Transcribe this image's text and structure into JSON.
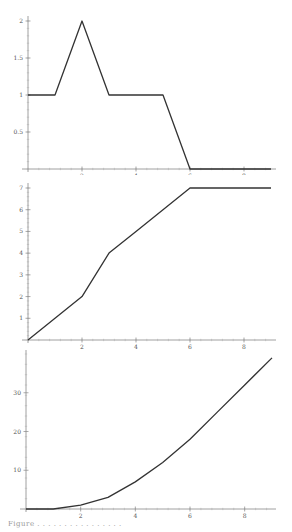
{
  "chart_data": [
    {
      "type": "line",
      "title": "",
      "xlabel": "",
      "ylabel": "",
      "x": [
        0,
        1,
        2,
        3,
        5,
        6,
        9
      ],
      "values": [
        1,
        1,
        2,
        1,
        1,
        0,
        0
      ],
      "xlim": [
        0,
        9
      ],
      "ylim": [
        0,
        2
      ],
      "xticks": [
        "2",
        "4",
        "6",
        "8"
      ],
      "yticks": [
        "0.5",
        "1",
        "1.5",
        "2"
      ],
      "grid": false,
      "line_color": "#333333"
    },
    {
      "type": "line",
      "title": "",
      "xlabel": "",
      "ylabel": "",
      "x": [
        0,
        1,
        2,
        3,
        4,
        5,
        6,
        9
      ],
      "values": [
        0,
        1,
        2,
        4,
        5,
        6,
        7,
        7
      ],
      "xlim": [
        0,
        9
      ],
      "ylim": [
        0,
        7
      ],
      "xticks": [
        "2",
        "4",
        "6",
        "8"
      ],
      "yticks": [
        "1",
        "2",
        "3",
        "4",
        "5",
        "6",
        "7"
      ],
      "grid": false,
      "line_color": "#333333"
    },
    {
      "type": "line",
      "title": "",
      "xlabel": "",
      "ylabel": "",
      "x": [
        0,
        1,
        2,
        3,
        4,
        5,
        6,
        7,
        8,
        9
      ],
      "values": [
        0,
        0,
        1,
        3,
        7,
        12,
        18,
        25,
        32,
        39
      ],
      "xlim": [
        0,
        9
      ],
      "ylim": [
        0,
        40
      ],
      "xticks": [
        "2",
        "4",
        "6",
        "8"
      ],
      "yticks": [
        "10",
        "20",
        "30"
      ],
      "grid": false,
      "line_color": "#333333"
    }
  ],
  "caption": "Figure . . . . . . . . . . . . . . . ."
}
